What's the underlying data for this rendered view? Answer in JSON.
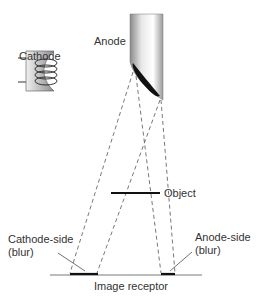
{
  "labels": {
    "anode": "Anode",
    "cathode": "Cathode",
    "object": "Object",
    "cathode_side_line1": "Cathode-side",
    "cathode_side_line2": "(blur)",
    "anode_side_line1": "Anode-side",
    "anode_side_line2": "(blur)",
    "image_receptor": "Image receptor"
  },
  "colors": {
    "line": "#333333",
    "dashed": "#555555",
    "bar": "#111111"
  }
}
